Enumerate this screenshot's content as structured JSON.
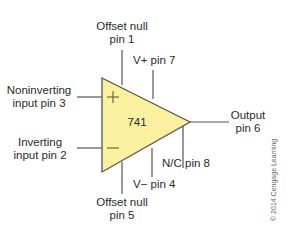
{
  "diagram": {
    "chip_label": "741",
    "plus_symbol": "+",
    "minus_symbol": "—",
    "fill_color": "#fbf0a0",
    "line_color": "#555555",
    "pins": {
      "offset_null_1": {
        "line1": "Offset null",
        "line2": "pin 1"
      },
      "vplus_7": {
        "line1": "V+ pin 7"
      },
      "noninverting_3": {
        "line1": "Noninverting",
        "line2": "input pin 3"
      },
      "inverting_2": {
        "line1": "Inverting",
        "line2": "input pin 2"
      },
      "output_6": {
        "line1": "Output",
        "line2": "pin 6"
      },
      "nc_8": {
        "line1": "N/C pin 8"
      },
      "vminus_4": {
        "line1": "V− pin 4"
      },
      "offset_null_5": {
        "line1": "Offset null",
        "line2": "pin 5"
      }
    },
    "copyright": "© 2014 Cengage Learning"
  }
}
